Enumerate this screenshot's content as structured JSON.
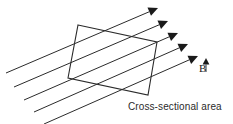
{
  "figure": {
    "type": "physics-diagram",
    "background_color": "#ffffff",
    "line_color": "#2b2b2b",
    "arrow_color": "#1a1a1a"
  },
  "labels": {
    "field_vector": "B",
    "field_vector_display": "B",
    "area_caption": "Cross-sectional area"
  },
  "chart_data": {
    "type": "scatter",
    "title": "",
    "xlabel": "",
    "ylabel": "",
    "grid": false,
    "legend": "none",
    "field_lines": [
      {
        "x1": 6,
        "y1": 73,
        "x2": 158,
        "y2": 8
      },
      {
        "x1": 14,
        "y1": 87,
        "x2": 168,
        "y2": 21
      },
      {
        "x1": 24,
        "y1": 100,
        "x2": 178,
        "y2": 33
      },
      {
        "x1": 34,
        "y1": 112,
        "x2": 188,
        "y2": 44
      },
      {
        "x1": 44,
        "y1": 124,
        "x2": 198,
        "y2": 56
      }
    ],
    "loop_vertices": [
      {
        "x": 78,
        "y": 25
      },
      {
        "x": 157,
        "y": 42
      },
      {
        "x": 148,
        "y": 95
      },
      {
        "x": 68,
        "y": 78
      }
    ],
    "field_vector_arrow": {
      "x1": 206,
      "y1": 72,
      "x2": 206,
      "y2": 58
    },
    "line_count": 5,
    "line_slope": -0.43,
    "line_angle_degrees": 23
  }
}
